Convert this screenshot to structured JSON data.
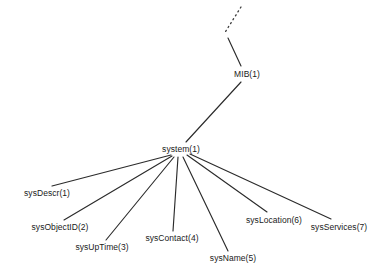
{
  "diagram": {
    "kind": "tree",
    "background_color": "#ffffff",
    "line_color": "#2b2b2b",
    "text_color": "#1a1a1a",
    "nodes": [
      {
        "id": "mib",
        "label": "MIB(1)",
        "x": 247,
        "y": 74,
        "anchor": "middle"
      },
      {
        "id": "system",
        "label": "system(1)",
        "x": 181,
        "y": 149,
        "anchor": "middle"
      },
      {
        "id": "sysDescr",
        "label": "sysDescr(1)",
        "x": 47,
        "y": 193,
        "anchor": "middle"
      },
      {
        "id": "sysObjectID",
        "label": "sysObjectID(2)",
        "x": 60,
        "y": 227,
        "anchor": "middle"
      },
      {
        "id": "sysUpTime",
        "label": "sysUpTime(3)",
        "x": 102,
        "y": 247,
        "anchor": "middle"
      },
      {
        "id": "sysContact",
        "label": "sysContact(4)",
        "x": 172,
        "y": 238,
        "anchor": "middle"
      },
      {
        "id": "sysName",
        "label": "sysName(5)",
        "x": 233,
        "y": 258,
        "anchor": "middle"
      },
      {
        "id": "sysLocation",
        "label": "sysLocation(6)",
        "x": 274,
        "y": 220,
        "anchor": "middle"
      },
      {
        "id": "sysServices",
        "label": "sysServices(7)",
        "x": 339,
        "y": 227,
        "anchor": "middle"
      }
    ],
    "edges": [
      {
        "id": "edge-ellipsis-up",
        "style": "dotted",
        "x1": 241,
        "y1": 7,
        "x2": 224,
        "y2": 34
      },
      {
        "id": "edge-ellipsis-mib",
        "style": "solid",
        "x1": 228,
        "y1": 38,
        "x2": 241,
        "y2": 66
      },
      {
        "id": "edge-mib-system",
        "style": "solid",
        "x1": 241,
        "y1": 82,
        "x2": 186,
        "y2": 142
      },
      {
        "id": "edge-system-sysDescr",
        "style": "solid",
        "x1": 171,
        "y1": 155,
        "x2": 52,
        "y2": 186
      },
      {
        "id": "edge-system-sysObjectID",
        "style": "solid",
        "x1": 172,
        "y1": 156,
        "x2": 64,
        "y2": 220
      },
      {
        "id": "edge-system-sysUpTime",
        "style": "solid",
        "x1": 174,
        "y1": 157,
        "x2": 106,
        "y2": 240
      },
      {
        "id": "edge-system-sysContact",
        "style": "solid",
        "x1": 178,
        "y1": 157,
        "x2": 173,
        "y2": 231
      },
      {
        "id": "edge-system-sysName",
        "style": "solid",
        "x1": 183,
        "y1": 157,
        "x2": 228,
        "y2": 251
      },
      {
        "id": "edge-system-sysLocation",
        "style": "solid",
        "x1": 187,
        "y1": 155,
        "x2": 267,
        "y2": 212
      },
      {
        "id": "edge-system-sysServices",
        "style": "solid",
        "x1": 190,
        "y1": 154,
        "x2": 331,
        "y2": 219
      }
    ]
  }
}
